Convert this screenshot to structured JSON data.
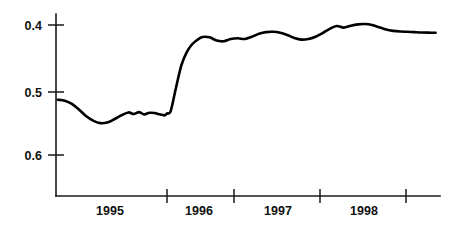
{
  "chart_data": {
    "type": "line",
    "title": "",
    "subtitle": "",
    "xlabel": "",
    "ylabel": "",
    "axis": {
      "y_inverted": true,
      "y_ticks": [
        "0.4",
        "0.5",
        "0.6"
      ],
      "y_tick_values": [
        0.4,
        0.5,
        0.6
      ],
      "ylim": [
        0.62,
        0.385
      ],
      "x_tick_labels": [
        "1995",
        "1996",
        "1997",
        "1998"
      ],
      "x_tick_positions": [
        1995.0,
        1996.0,
        1997.0,
        1998.0,
        1999.0
      ],
      "xlim": [
        1994.7,
        1999.05
      ],
      "grid": false,
      "legend": "none"
    },
    "series": [
      {
        "name": "series-1",
        "x": [
          1994.72,
          1994.8,
          1994.88,
          1994.96,
          1995.04,
          1995.12,
          1995.2,
          1995.28,
          1995.36,
          1995.44,
          1995.52,
          1995.58,
          1995.64,
          1995.7,
          1995.76,
          1995.82,
          1995.86,
          1995.9,
          1995.93,
          1995.96,
          1996.0,
          1996.06,
          1996.12,
          1996.18,
          1996.24,
          1996.3,
          1996.36,
          1996.44,
          1996.52,
          1996.6,
          1996.68,
          1996.76,
          1996.84,
          1996.92,
          1997.0,
          1997.08,
          1997.16,
          1997.24,
          1997.32,
          1997.4,
          1997.48,
          1997.56,
          1997.64,
          1997.72,
          1997.8,
          1997.88,
          1997.96,
          1998.04,
          1998.12,
          1998.2,
          1998.28,
          1998.36,
          1998.44,
          1998.52,
          1998.6,
          1998.68,
          1998.76,
          1998.84,
          1998.92,
          1999.0
        ],
        "y": [
          0.515,
          0.5165,
          0.5215,
          0.53,
          0.54,
          0.547,
          0.551,
          0.55,
          0.545,
          0.539,
          0.5345,
          0.537,
          0.534,
          0.5375,
          0.535,
          0.5355,
          0.537,
          0.538,
          0.539,
          0.536,
          0.532,
          0.496,
          0.462,
          0.442,
          0.43,
          0.423,
          0.4185,
          0.419,
          0.424,
          0.425,
          0.4215,
          0.4205,
          0.4215,
          0.418,
          0.4135,
          0.411,
          0.4105,
          0.412,
          0.4155,
          0.42,
          0.4225,
          0.4215,
          0.418,
          0.4125,
          0.406,
          0.4015,
          0.404,
          0.401,
          0.399,
          0.3985,
          0.4,
          0.4035,
          0.407,
          0.409,
          0.41,
          0.4105,
          0.411,
          0.4115,
          0.4118,
          0.412
        ]
      }
    ]
  },
  "axis_labels": {
    "y0": "0.4",
    "y1": "0.5",
    "y2": "0.6",
    "x0": "1995",
    "x1": "1996",
    "x2": "1997",
    "x3": "1998"
  },
  "colors": {
    "line": "#000000",
    "axis": "#1a1a1a",
    "background": "#ffffff"
  }
}
